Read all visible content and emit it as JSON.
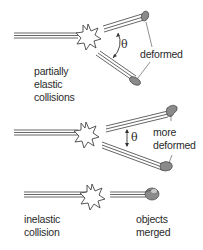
{
  "diagram": {
    "panels": [
      {
        "id": "partially-elastic",
        "label_lines": [
          "partially",
          "elastic",
          "collisions"
        ],
        "annotation": "deformed",
        "angle_symbol": "θ"
      },
      {
        "id": "more-deformed",
        "annotation_lines": [
          "more",
          "deformed"
        ],
        "angle_symbol": "θ"
      },
      {
        "id": "inelastic",
        "label_lines": [
          "inelastic",
          "collision"
        ],
        "annotation_lines": [
          "objects",
          "merged"
        ]
      }
    ],
    "colors": {
      "lines": "#555555",
      "object": "#8a8a8a",
      "object_highlight": "#c8c8c8",
      "text": "#2a2a2a"
    }
  }
}
